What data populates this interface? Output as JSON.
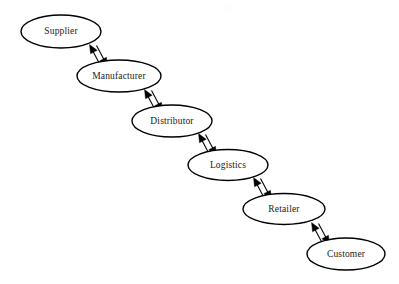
{
  "diagram": {
    "background_color": "#ffffff",
    "stroke_color": "#000000",
    "node_fill_color": "#ffffff",
    "text_color": "#1a1a1a",
    "node_shape": "ellipse",
    "edge_style": "double-arrow-bidirectional",
    "nodes": [
      {
        "id": "supplier",
        "label": "Supplier",
        "cx": 61,
        "cy": 31.5,
        "rx": 40,
        "ry": 16.5
      },
      {
        "id": "manufacturer",
        "label": "Manufacturer",
        "cx": 119,
        "cy": 76,
        "rx": 42,
        "ry": 16
      },
      {
        "id": "distributor",
        "label": "Distributor",
        "cx": 172,
        "cy": 121,
        "rx": 40,
        "ry": 16
      },
      {
        "id": "logistics",
        "label": "Logistics",
        "cx": 228,
        "cy": 165,
        "rx": 40,
        "ry": 15.5
      },
      {
        "id": "retailer",
        "label": "Retailer",
        "cx": 284,
        "cy": 209,
        "rx": 41,
        "ry": 15.5
      },
      {
        "id": "customer",
        "label": "Customer",
        "cx": 346,
        "cy": 254,
        "rx": 39,
        "ry": 16
      }
    ],
    "edges": [
      {
        "id": "supplier-manufacturer",
        "from": "supplier",
        "to": "manufacturer",
        "direction": "bidirectional"
      },
      {
        "id": "manufacturer-distributor",
        "from": "manufacturer",
        "to": "distributor",
        "direction": "bidirectional"
      },
      {
        "id": "distributor-logistics",
        "from": "distributor",
        "to": "logistics",
        "direction": "bidirectional"
      },
      {
        "id": "logistics-retailer",
        "from": "logistics",
        "to": "retailer",
        "direction": "bidirectional"
      },
      {
        "id": "retailer-customer",
        "from": "retailer",
        "to": "customer",
        "direction": "bidirectional"
      }
    ]
  }
}
